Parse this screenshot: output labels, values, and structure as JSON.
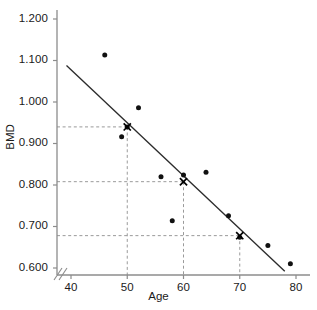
{
  "chart_data": {
    "type": "scatter",
    "title": "",
    "xlabel": "Age",
    "ylabel": "BMD",
    "xlim": [
      38,
      82
    ],
    "ylim": [
      0.58,
      1.24
    ],
    "grid": false,
    "legend": null,
    "axis_break": true,
    "xticks": [
      40,
      50,
      60,
      70,
      80
    ],
    "xtick_labels": [
      "40",
      "50",
      "60",
      "70",
      "80"
    ],
    "yticks": [
      0.6,
      0.7,
      0.8,
      0.9,
      1.0,
      1.1,
      1.2
    ],
    "ytick_labels": [
      "0.600",
      "0.700",
      "0.800",
      "0.900",
      "1.000",
      "1.100",
      "1.200"
    ],
    "x": [
      46,
      49,
      50,
      52,
      56,
      58,
      60,
      64,
      68,
      70,
      75,
      79
    ],
    "y": [
      1.113,
      0.916,
      0.94,
      0.986,
      0.82,
      0.714,
      0.824,
      0.831,
      0.726,
      0.674,
      0.654,
      0.61
    ],
    "series": [
      {
        "name": "observations",
        "marker": "circle",
        "points": [
          {
            "x": 46,
            "y": 1.113
          },
          {
            "x": 49,
            "y": 0.916
          },
          {
            "x": 50,
            "y": 0.94
          },
          {
            "x": 52,
            "y": 0.986
          },
          {
            "x": 56,
            "y": 0.82
          },
          {
            "x": 58,
            "y": 0.714
          },
          {
            "x": 60,
            "y": 0.824
          },
          {
            "x": 64,
            "y": 0.831
          },
          {
            "x": 68,
            "y": 0.726
          },
          {
            "x": 70,
            "y": 0.674
          },
          {
            "x": 75,
            "y": 0.654
          },
          {
            "x": 79,
            "y": 0.61
          }
        ]
      },
      {
        "name": "predicted-values",
        "marker": "x",
        "points": [
          {
            "x": 50,
            "y": 0.94
          },
          {
            "x": 60,
            "y": 0.808
          },
          {
            "x": 70,
            "y": 0.678
          }
        ]
      }
    ],
    "regression_line": {
      "name": "fitted-regression-line",
      "x_start": 39.2,
      "y_start": 1.088,
      "x_end": 78.0,
      "y_end": 0.592
    },
    "reference_lines": [
      {
        "x": 50,
        "y": 0.94
      },
      {
        "x": 60,
        "y": 0.808
      },
      {
        "x": 70,
        "y": 0.678
      }
    ]
  }
}
